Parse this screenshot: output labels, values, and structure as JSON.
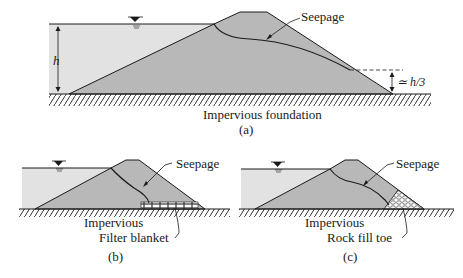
{
  "figure": {
    "panel_a": {
      "seepage_label": "Seepage",
      "height_label": "h",
      "tailwater_label": "≃ h/3",
      "foundation_label": "Impervious foundation",
      "caption": "(a)"
    },
    "panel_b": {
      "seepage_label": "Seepage",
      "foundation_label": "Impervious",
      "filter_label": "Filter blanket",
      "caption": "(b)"
    },
    "panel_c": {
      "seepage_label": "Seepage",
      "foundation_label": "Impervious",
      "toe_label": "Rock fill toe",
      "caption": "(c)"
    },
    "colors": {
      "water": "#e2e2e2",
      "dam": "#b8b8b8",
      "line": "#1a1a1a",
      "background": "#ffffff"
    }
  }
}
